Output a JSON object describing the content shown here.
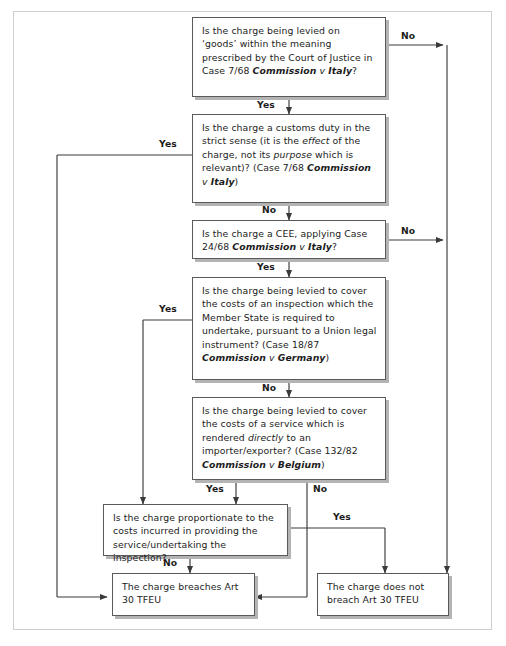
{
  "diagram": {
    "frame": {
      "border_color": "#cfcfcf"
    },
    "node_style": {
      "border_color": "#5a5a5a",
      "shadow_color": "#b4b4b4",
      "fill": "#ffffff"
    },
    "nodes": [
      {
        "id": "q1",
        "name": "question-goods",
        "text": "Is the charge being levied on 'goods' within the meaning prescribed by the Court of Justice in Case 7/68 Commission v Italy?",
        "case": "Case 7/68",
        "case_name": "Commission v Italy"
      },
      {
        "id": "q2",
        "name": "question-customs-duty",
        "text": "Is the charge a customs duty in the strict sense (it is the effect of the charge, not its purpose which is relevant)? (Case 7/68 Commission v Italy)",
        "case": "Case 7/68",
        "case_name": "Commission v Italy"
      },
      {
        "id": "q3",
        "name": "question-cee",
        "text": "Is the charge a CEE, applying Case 24/68 Commission v Italy?",
        "case": "Case 24/68",
        "case_name": "Commission v Italy"
      },
      {
        "id": "q4",
        "name": "question-inspection-union-obligation",
        "text": "Is the charge being levied to cover the costs of an inspection which the Member State is required to undertake, pursuant to a Union legal instrument? (Case 18/87 Commission v Germany)",
        "case": "Case 18/87",
        "case_name": "Commission v Germany"
      },
      {
        "id": "q5",
        "name": "question-service-rendered-directly",
        "text": "Is the charge being levied to cover the costs of a service which is rendered directly to an importer/exporter? (Case 132/82 Commission v Belgium)",
        "case": "Case 132/82",
        "case_name": "Commission v Belgium"
      },
      {
        "id": "q6",
        "name": "question-proportionate",
        "text": "Is the charge proportionate to the costs incurred in providing the service/undertaking the inspection?"
      },
      {
        "id": "r1",
        "name": "outcome-breaches",
        "text": "The charge breaches Art 30 TFEU"
      },
      {
        "id": "r2",
        "name": "outcome-does-not-breach",
        "text": "The charge does not breach Art 30 TFEU"
      }
    ],
    "edge_labels": [
      {
        "id": "e1",
        "name": "edge-label-q1-no",
        "text": "No"
      },
      {
        "id": "e2",
        "name": "edge-label-q1-yes",
        "text": "Yes"
      },
      {
        "id": "e3",
        "name": "edge-label-q2-yes",
        "text": "Yes"
      },
      {
        "id": "e4",
        "name": "edge-label-q2-no",
        "text": "No"
      },
      {
        "id": "e5",
        "name": "edge-label-q3-no",
        "text": "No"
      },
      {
        "id": "e6",
        "name": "edge-label-q3-yes",
        "text": "Yes"
      },
      {
        "id": "e7",
        "name": "edge-label-q4-yes",
        "text": "Yes"
      },
      {
        "id": "e8",
        "name": "edge-label-q4-no",
        "text": "No"
      },
      {
        "id": "e9",
        "name": "edge-label-q5-yes",
        "text": "Yes"
      },
      {
        "id": "e10",
        "name": "edge-label-q5-no",
        "text": "No"
      },
      {
        "id": "e11",
        "name": "edge-label-q6-yes",
        "text": "Yes"
      },
      {
        "id": "e12",
        "name": "edge-label-q6-no",
        "text": "No"
      }
    ]
  }
}
